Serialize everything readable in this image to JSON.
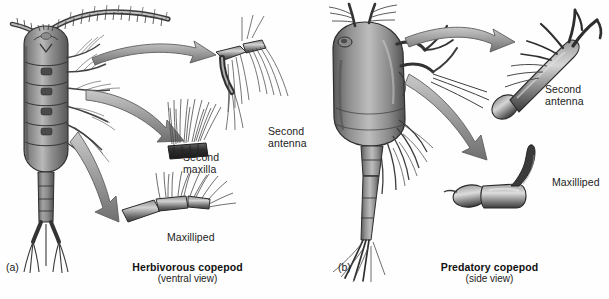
{
  "figure": {
    "background_color": "#ffffff",
    "ink_color": "#2b2b2b",
    "arrow_fill": "#9a9a9a",
    "arrow_stroke": "#5e5e5e"
  },
  "panels": [
    {
      "index_label": "(a)",
      "caption_title": "Herbivorous copepod",
      "caption_subtitle": "(ventral view)",
      "organism": "herbivorous-copepod",
      "view": "ventral",
      "callouts": [
        {
          "name": "second-antenna",
          "label_line1": "Second",
          "label_line2": "antenna"
        },
        {
          "name": "second-maxilla",
          "label_line1": "Second",
          "label_line2": "maxilla"
        },
        {
          "name": "maxilliped",
          "label_line1": "Maxilliped",
          "label_line2": ""
        }
      ],
      "arrow_count": 3
    },
    {
      "index_label": "(b)",
      "caption_title": "Predatory copepod",
      "caption_subtitle": "(side view)",
      "organism": "predatory-copepod",
      "view": "side",
      "callouts": [
        {
          "name": "second-antenna",
          "label_line1": "Second",
          "label_line2": "antenna"
        },
        {
          "name": "maxilliped",
          "label_line1": "Maxilliped",
          "label_line2": ""
        }
      ],
      "arrow_count": 2
    }
  ],
  "labels": {
    "a_index": "(a)",
    "a_second_antenna_1": "Second",
    "a_second_antenna_2": "antenna",
    "a_second_maxilla_1": "Second",
    "a_second_maxilla_2": "maxilla",
    "a_maxilliped": "Maxilliped",
    "a_caption": "Herbivorous copepod",
    "a_caption_sub": "(ventral view)",
    "b_index": "(b)",
    "b_second_antenna_1": "Second",
    "b_second_antenna_2": "antenna",
    "b_maxilliped": "Maxilliped",
    "b_caption": "Predatory copepod",
    "b_caption_sub": "(side view)"
  }
}
